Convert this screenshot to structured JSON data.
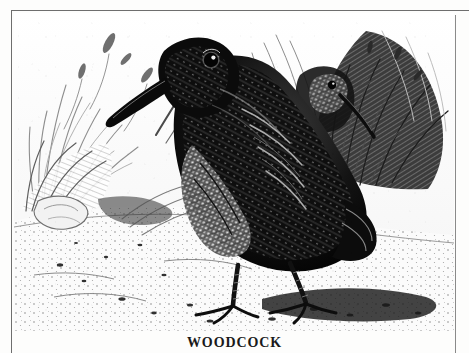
{
  "plate": {
    "subject": "woodcock",
    "technique": "wood engraving",
    "palette": {
      "paper": "#ffffff",
      "ink": "#111111",
      "mid_tone": "#6b6b6b",
      "light_tone": "#b8b8b8",
      "rule": "#6e6e6e"
    },
    "scene": {
      "foreground_bird": "woodcock standing in profile facing left, long straight bill angled down-left, large dark eye set high on head",
      "background_bird": "second woodcock head among reeds at upper right, bill angled down-right",
      "vegetation_left": "tall marsh grasses and seed heads",
      "vegetation_right": "dense dark sedge clump and stems",
      "ground": "stippled pebbled bank with pale rock at left",
      "shadow": "heavy cast shadow to the right of the bird's feet"
    }
  },
  "caption": {
    "text": "WOODCOCK"
  },
  "frame": {
    "top_rule": "",
    "left_rule": "",
    "right_rule": ""
  }
}
